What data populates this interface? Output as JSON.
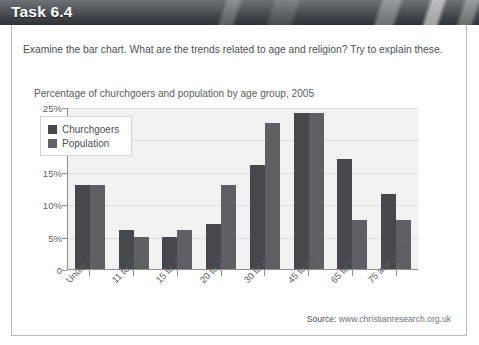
{
  "header": {
    "title": "Task 6.4"
  },
  "prompt": {
    "text": "Examine the bar chart. What are the trends related to age and religion? Try to explain these."
  },
  "source": {
    "label": "Source:",
    "url": "www.christianresearch.org.uk"
  },
  "chart_data": {
    "type": "bar",
    "title": "Percentage of churchgoers and population by age group, 2005",
    "xlabel": "",
    "ylabel": "",
    "ylim": [
      0,
      25
    ],
    "ytick_labels": [
      "25%",
      "20%",
      "15%",
      "10%",
      "5%",
      "0"
    ],
    "ytick_values": [
      25,
      20,
      15,
      10,
      5,
      0
    ],
    "grid": true,
    "legend_position": "top-left",
    "categories": [
      "Under 11",
      "11 to 14",
      "15 to 19",
      "20 to 29",
      "30 to 44",
      "45 to 64",
      "65 to 74",
      "75 and over"
    ],
    "series": [
      {
        "name": "Churchgoers",
        "color": "#46484b",
        "values": [
          13,
          6,
          5,
          7,
          16,
          24,
          17,
          11.5
        ]
      },
      {
        "name": "Population",
        "color": "#5e6063",
        "values": [
          13,
          5,
          6,
          13,
          22.5,
          24,
          7.5,
          7.5
        ]
      }
    ]
  }
}
